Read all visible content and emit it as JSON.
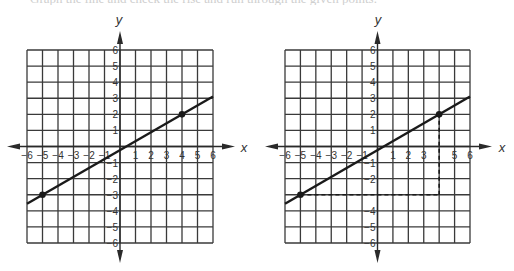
{
  "header": {
    "clipped_text": "Graph the line and check the rise and run through the given points."
  },
  "chart_data": [
    {
      "type": "line",
      "title": "",
      "xlabel": "x",
      "ylabel": "y",
      "xlim": [
        -6,
        6
      ],
      "ylim": [
        -6,
        6
      ],
      "grid": true,
      "x_ticks": [
        -6,
        -5,
        -4,
        -3,
        -2,
        -1,
        1,
        2,
        3,
        4,
        5,
        6
      ],
      "y_ticks": [
        -6,
        -5,
        -4,
        -3,
        -2,
        -1,
        1,
        2,
        3,
        4,
        5,
        6
      ],
      "points": [
        {
          "x": -5,
          "y": -3
        },
        {
          "x": 4,
          "y": 2
        }
      ],
      "line": {
        "slope": 0.5556,
        "intercept": -0.2222,
        "x_range": [
          -6,
          6
        ]
      },
      "guides": []
    },
    {
      "type": "line",
      "title": "",
      "xlabel": "x",
      "ylabel": "y",
      "xlim": [
        -6,
        6
      ],
      "ylim": [
        -6,
        6
      ],
      "grid": true,
      "x_ticks": [
        -6,
        -5,
        -4,
        -3,
        -2,
        -1,
        1,
        2,
        3,
        5,
        6
      ],
      "y_ticks": [
        -6,
        -5,
        -4,
        -2,
        -1,
        1,
        2,
        3,
        4,
        5,
        6
      ],
      "points": [
        {
          "x": -5,
          "y": -3
        },
        {
          "x": 4,
          "y": 2
        }
      ],
      "line": {
        "slope": 0.5556,
        "intercept": -0.2222,
        "x_range": [
          -6,
          6
        ]
      },
      "guides": [
        {
          "from": {
            "x": -5,
            "y": -3
          },
          "to": {
            "x": 4,
            "y": -3
          },
          "style": "dashed",
          "label": "run"
        },
        {
          "from": {
            "x": 4,
            "y": -3
          },
          "to": {
            "x": 4,
            "y": 2
          },
          "style": "dashed",
          "label": "rise"
        }
      ]
    }
  ],
  "layout": [
    {
      "grid_left": 27,
      "grid_right": 213,
      "grid_top": 50,
      "grid_bottom": 243,
      "axis_left_tip": 7,
      "axis_right_tip": 235,
      "axis_top_tip": 31,
      "axis_bottom_tip": 263,
      "x_label_pos": [
        244,
        152
      ],
      "y_label_pos": [
        119,
        24
      ]
    },
    {
      "grid_left": 285,
      "grid_right": 470,
      "grid_top": 50,
      "grid_bottom": 243,
      "axis_left_tip": 265,
      "axis_right_tip": 492,
      "axis_top_tip": 31,
      "axis_bottom_tip": 263,
      "x_label_pos": [
        502,
        152
      ],
      "y_label_pos": [
        378,
        24
      ]
    }
  ]
}
